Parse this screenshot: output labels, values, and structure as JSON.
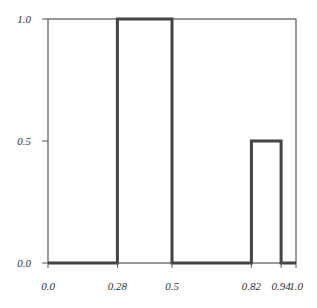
{
  "chart_data": {
    "type": "line",
    "subtype": "step",
    "title": "",
    "xlabel": "",
    "ylabel": "",
    "xlim": [
      0.0,
      1.0
    ],
    "ylim": [
      0.0,
      1.0
    ],
    "grid": false,
    "legend": null,
    "x_ticks": [
      "0.0",
      "0.28",
      "0.5",
      "0.82",
      "0.94",
      "1.0"
    ],
    "y_ticks": [
      "0.0",
      "0.5",
      "1.0"
    ],
    "x_tick_values": [
      0.0,
      0.28,
      0.5,
      0.82,
      0.94,
      1.0
    ],
    "y_tick_values": [
      0.0,
      0.5,
      1.0
    ],
    "series": [
      {
        "name": "step function",
        "x": [
          0.0,
          0.28,
          0.28,
          0.5,
          0.5,
          0.82,
          0.82,
          0.94,
          0.94,
          1.0
        ],
        "y": [
          0.0,
          0.0,
          1.0,
          1.0,
          0.0,
          0.0,
          0.5,
          0.5,
          0.0,
          0.0
        ]
      }
    ],
    "colors": {
      "series": "#444444",
      "axis": "#555555",
      "text": "#333333"
    }
  }
}
